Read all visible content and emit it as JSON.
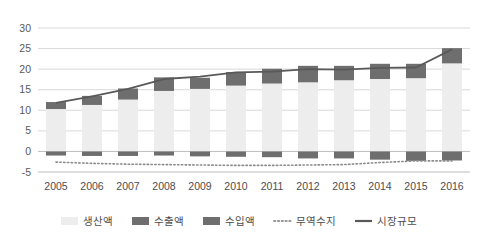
{
  "chart_data": {
    "type": "bar",
    "title": "",
    "subtitle": "",
    "xlabel": "",
    "ylabel": "",
    "ylim": [
      -5,
      30
    ],
    "yticks": [
      -5,
      0,
      5,
      10,
      15,
      20,
      25,
      30
    ],
    "grid": true,
    "legend_position": "bottom",
    "categories": [
      "2005",
      "2006",
      "2007",
      "2008",
      "2009",
      "2010",
      "2011",
      "2012",
      "2013",
      "2014",
      "2015",
      "2016"
    ],
    "series": [
      {
        "name": "생산액",
        "type": "bar",
        "stack": "main",
        "color": "#ededed",
        "values": [
          10.3,
          11.3,
          12.6,
          14.7,
          15.2,
          16.0,
          16.5,
          16.8,
          17.3,
          17.6,
          17.8,
          21.4
        ]
      },
      {
        "name": "수출액",
        "type": "bar",
        "stack": "main",
        "color": "#6e6e6e",
        "values": [
          1.7,
          2.2,
          2.7,
          3.3,
          2.7,
          3.3,
          3.6,
          4.0,
          3.5,
          3.7,
          3.5,
          3.7
        ]
      },
      {
        "name": "수입액",
        "type": "bar",
        "stack": "neg",
        "color": "#6e6e6e",
        "values": [
          -1.0,
          -1.1,
          -1.1,
          -1.0,
          -1.2,
          -1.3,
          -1.4,
          -1.7,
          -1.7,
          -2.0,
          -2.3,
          -2.2
        ]
      },
      {
        "name": "무역수지",
        "type": "line",
        "style": "dotted",
        "color": "#8c8c8c",
        "values": [
          -2.6,
          -2.9,
          -3.1,
          -3.2,
          -3.3,
          -3.4,
          -3.4,
          -3.3,
          -3.2,
          -2.7,
          -2.3,
          -2.3
        ]
      },
      {
        "name": "시장규모",
        "type": "line",
        "style": "solid",
        "color": "#595959",
        "values": [
          11.8,
          13.4,
          15.2,
          17.6,
          18.2,
          19.2,
          19.4,
          20.0,
          19.9,
          20.3,
          20.4,
          24.8
        ]
      }
    ]
  },
  "legend": {
    "items": [
      {
        "label": "생산액",
        "marker": "swatch-light",
        "color": "#ededed"
      },
      {
        "label": "수출액",
        "marker": "swatch-dark",
        "color": "#6e6e6e"
      },
      {
        "label": "수입액",
        "marker": "swatch-dark",
        "color": "#6e6e6e"
      },
      {
        "label": "무역수지",
        "marker": "dotted-line",
        "color": "#9a9a9a"
      },
      {
        "label": "시장규모",
        "marker": "solid-line",
        "color": "#595959"
      }
    ]
  },
  "colors": {
    "background": "#ffffff",
    "grid": "#d9d9d9",
    "axis": "#bdbdbd",
    "bar_light": "#ededed",
    "bar_dark": "#6e6e6e",
    "line_market": "#595959",
    "line_balance": "#9a9a9a",
    "tick_text": "#5a5a5a",
    "legend_text": "#4d4d4d"
  }
}
